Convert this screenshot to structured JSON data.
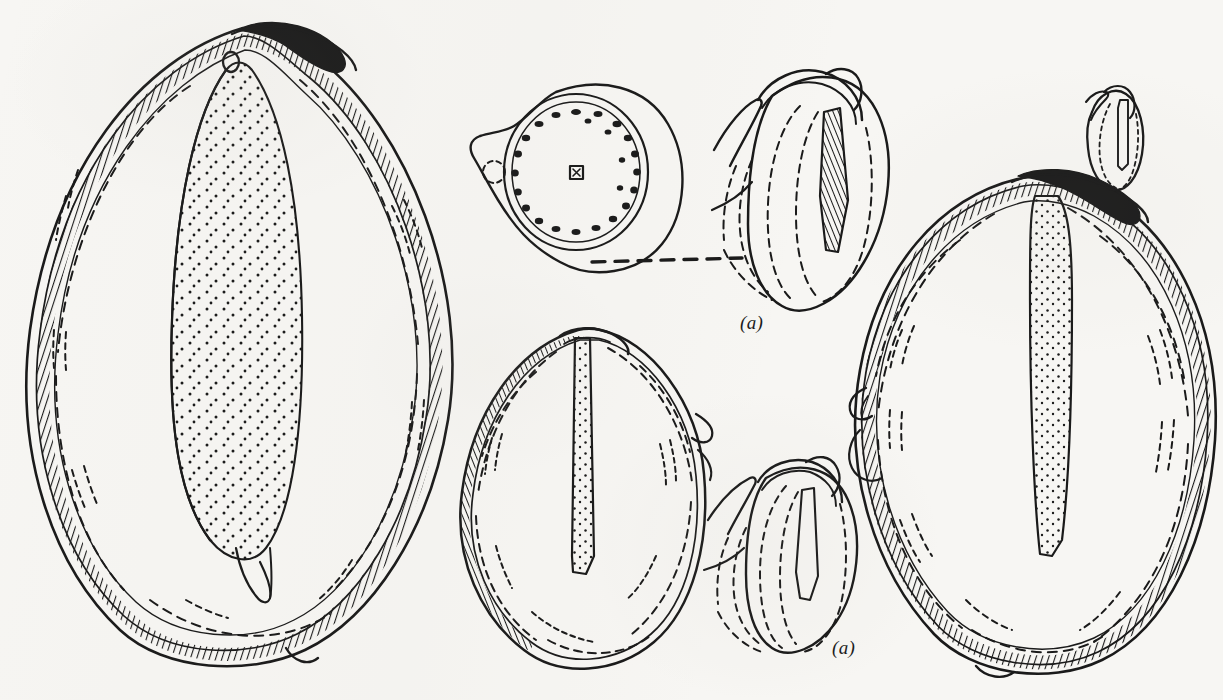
{
  "plate": {
    "kind": "scientific-line-drawing",
    "subject": "seed and fruit anatomy plate",
    "width": 1223,
    "height": 700,
    "background_color": "#f7f6f3",
    "ink_color": "#1a1a1a",
    "description": "Pen-and-ink botanical plate: two large longitudinal sections of a seed/fruit, one transverse section with a ring of vascular bundles, three embryo details, and a very small embryo at upper right. A horizontal dashed leader line connects the transverse section to the upper embryo detail."
  },
  "labels": [
    {
      "id": "label-a-upper",
      "text": "(a)",
      "x": 740,
      "y": 312,
      "style": "italic"
    },
    {
      "id": "label-a-lower",
      "text": "(a)",
      "x": 832,
      "y": 637,
      "style": "italic"
    }
  ],
  "figures": [
    {
      "id": "fig-left-longitudinal",
      "name": "left-longitudinal-section",
      "role": "Large longitudinal section of seed showing stippled endosperm body, double pericarp wall with hatched texture and dashed inner lines",
      "bbox": [
        18,
        22,
        455,
        660
      ],
      "features": [
        "stippled-endosperm",
        "hatched-pericarp",
        "dashed-inner-layer",
        "apical-beak",
        "basal-notch",
        "hilum-ring"
      ]
    },
    {
      "id": "fig-transverse-section",
      "name": "transverse-section",
      "role": "Transverse (cross) section showing outer rim, inner ring of small vascular bundle dots and a central square bundle",
      "bbox": [
        466,
        78,
        200,
        190
      ],
      "features": [
        "outer-rim",
        "vascular-bundle-ring",
        "central-bundle",
        "lateral-wing",
        "dashed-circle"
      ]
    },
    {
      "id": "fig-embryo-upper",
      "name": "embryo-detail-upper",
      "role": "Embryo detail with cotyledon, plumule and dashed internal outlines; labelled (a)",
      "bbox": [
        712,
        62,
        175,
        260
      ],
      "features": [
        "cotyledon",
        "plumule-hook",
        "dashed-internal-outline",
        "hatched-radicle"
      ]
    },
    {
      "id": "fig-mid-longitudinal",
      "name": "middle-longitudinal-section",
      "role": "Medium longitudinal section of seed with narrow central raphe and dashed inner wall",
      "bbox": [
        452,
        328,
        250,
        330
      ],
      "features": [
        "central-raphe",
        "dashed-inner-layer",
        "lateral-beak"
      ]
    },
    {
      "id": "fig-embryo-lower",
      "name": "embryo-detail-lower",
      "role": "Smaller embryo detail with dashed internal outlines; labelled (a)",
      "bbox": [
        706,
        452,
        170,
        215
      ],
      "features": [
        "cotyledon",
        "plumule-hook",
        "dashed-internal-outline"
      ]
    },
    {
      "id": "fig-right-longitudinal",
      "name": "right-longitudinal-section",
      "role": "Large broad longitudinal section with stippled central raphe column and heavily hatched pericarp",
      "bbox": [
        845,
        168,
        375,
        505
      ],
      "features": [
        "stippled-raphe",
        "hatched-pericarp",
        "dashed-inner-layer",
        "apical-beak",
        "lateral-flap"
      ]
    },
    {
      "id": "fig-embryo-tiny",
      "name": "embryo-detail-tiny",
      "role": "Very small embryo at natural size, upper right",
      "bbox": [
        1078,
        88,
        62,
        105
      ],
      "features": [
        "cotyledon",
        "dotted-outline"
      ]
    }
  ],
  "connectors": [
    {
      "id": "leader-dashed",
      "name": "dashed-leader-line",
      "from": "fig-transverse-section",
      "to": "fig-embryo-upper",
      "x1": 592,
      "y1": 262,
      "x2": 742,
      "y2": 258,
      "style": "dashed"
    }
  ]
}
